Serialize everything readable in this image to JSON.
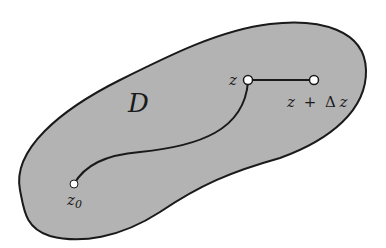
{
  "diagram": {
    "region_label": "D",
    "points": {
      "start": {
        "label_base": "z",
        "label_sub": "0"
      },
      "current": {
        "label": "z"
      },
      "increment": {
        "label_z": "z",
        "label_plus": "+",
        "label_delta": "Δ",
        "label_z2": "z"
      }
    },
    "colors": {
      "region_fill": "#b3b3b3",
      "outline": "#1a1a1a",
      "point_fill": "#ffffff",
      "background": "#ffffff"
    }
  }
}
